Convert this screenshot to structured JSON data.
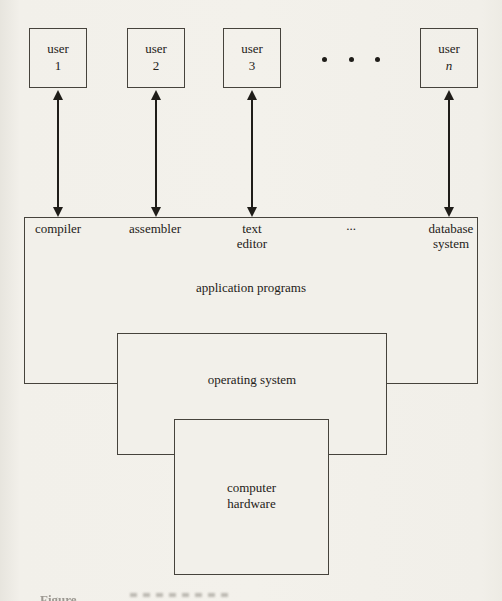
{
  "figure": {
    "users": [
      {
        "name": "user",
        "number": "1"
      },
      {
        "name": "user",
        "number": "2"
      },
      {
        "name": "user",
        "number": "3"
      },
      {
        "name": "user",
        "number": "n"
      }
    ],
    "application_layer": {
      "title": "application programs",
      "programs": [
        {
          "line1": "compiler",
          "line2": ""
        },
        {
          "line1": "assembler",
          "line2": ""
        },
        {
          "line1": "text",
          "line2": "editor"
        },
        {
          "line1": "...",
          "line2": ""
        },
        {
          "line1": "database",
          "line2": "system"
        }
      ]
    },
    "os_layer": {
      "title": "operating system"
    },
    "hardware_layer": {
      "line1": "computer",
      "line2": "hardware"
    },
    "caption_fragment": "Figure"
  },
  "colors": {
    "paper": "#f2f0ea",
    "box_line": "#46433c",
    "arrow": "#1f1d19",
    "text": "#242118"
  }
}
